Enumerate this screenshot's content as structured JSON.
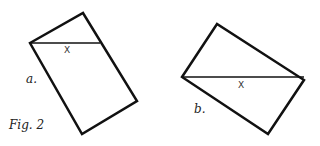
{
  "figure": {
    "caption": "Fig. 2",
    "panels": [
      {
        "label": "a.",
        "x_label": "X"
      },
      {
        "label": "b.",
        "x_label": "X"
      }
    ]
  }
}
